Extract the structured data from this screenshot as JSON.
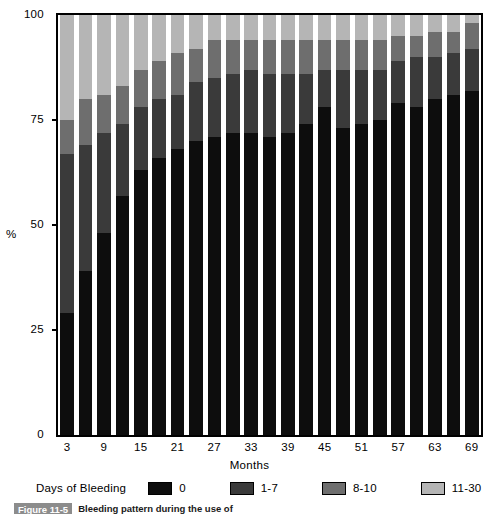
{
  "chart_data": {
    "type": "bar",
    "subtype": "stacked-bar-100-percent",
    "title": "",
    "xlabel": "Months",
    "ylabel": "%",
    "ylim": [
      0,
      100
    ],
    "yticks": [
      0,
      25,
      50,
      75,
      100
    ],
    "ytick_labels": [
      "0",
      "25",
      "50",
      "75",
      "100"
    ],
    "grid": false,
    "legend_position": "bottom",
    "legend_title": "Days of Bleeding",
    "categories": [
      3,
      6,
      9,
      12,
      15,
      18,
      21,
      24,
      27,
      30,
      33,
      36,
      39,
      42,
      45,
      48,
      51,
      54,
      57,
      60,
      63,
      66,
      69
    ],
    "xtick_labels": [
      "3",
      "9",
      "15",
      "21",
      "27",
      "33",
      "39",
      "45",
      "51",
      "57",
      "63",
      "69"
    ],
    "xtick_values": [
      3,
      9,
      15,
      21,
      27,
      33,
      39,
      45,
      51,
      57,
      63,
      69
    ],
    "series": [
      {
        "name": "0",
        "color": "#0d0d0d",
        "values": [
          29,
          39,
          48,
          57,
          63,
          66,
          68,
          70,
          71,
          72,
          72,
          71,
          72,
          74,
          78,
          73,
          74,
          75,
          79,
          78,
          80,
          81,
          82
        ]
      },
      {
        "name": "1-7",
        "color": "#3a3a3a",
        "values": [
          38,
          30,
          24,
          17,
          15,
          14,
          13,
          14,
          14,
          14,
          15,
          15,
          14,
          12,
          9,
          14,
          13,
          12,
          10,
          12,
          10,
          10,
          10
        ]
      },
      {
        "name": "8-10",
        "color": "#6e6e6e",
        "values": [
          8,
          11,
          9,
          9,
          9,
          9,
          10,
          8,
          9,
          8,
          7,
          8,
          8,
          8,
          7,
          7,
          7,
          7,
          6,
          5,
          6,
          5,
          6
        ]
      },
      {
        "name": "11-30",
        "color": "#b5b5b5",
        "values": [
          25,
          20,
          19,
          17,
          13,
          11,
          9,
          8,
          6,
          6,
          6,
          6,
          6,
          6,
          6,
          6,
          6,
          6,
          5,
          5,
          4,
          4,
          2
        ]
      }
    ]
  },
  "axes": {
    "y_axis_label": "%",
    "x_axis_label": "Months"
  },
  "legend": {
    "title": "Days of Bleeding",
    "items": [
      {
        "label": "0",
        "color": "#0d0d0d"
      },
      {
        "label": "1-7",
        "color": "#3a3a3a"
      },
      {
        "label": "8-10",
        "color": "#6e6e6e"
      },
      {
        "label": "11-30",
        "color": "#b5b5b5"
      }
    ]
  },
  "caption": {
    "tag": "Figure 11-5",
    "text": "Bleeding pattern during the use of"
  },
  "colors": {
    "axis": "#000000",
    "background": "#ffffff",
    "seg_0": "#0d0d0d",
    "seg_1_7": "#3a3a3a",
    "seg_8_10": "#6e6e6e",
    "seg_11_30": "#b5b5b5"
  }
}
